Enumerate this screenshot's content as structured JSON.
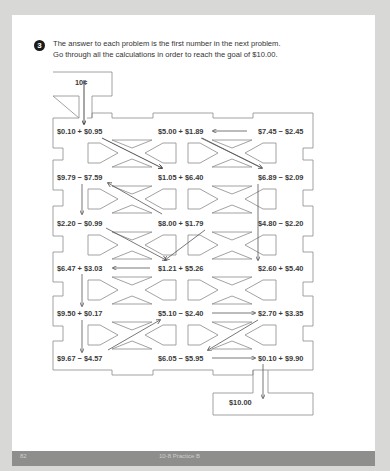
{
  "problem": {
    "number": "3",
    "instructions": [
      "The answer to each problem is the first number in the next problem.",
      "Go through all the calculations in order to reach the goal of $10.00."
    ]
  },
  "maze": {
    "start": "10¢",
    "goal": "$10.00",
    "rows": [
      [
        "$0.10 + $0.95",
        "$5.00 + $1.89",
        "$7.45 − $2.45"
      ],
      [
        "$9.79 − $7.59",
        "$1.05 + $6.40",
        "$6.89 − $2.09"
      ],
      [
        "$2.20 − $0.99",
        "$8.00 + $1.79",
        "$4.80 − $2.20"
      ],
      [
        "$6.47 + $3.03",
        "$1.21 + $5.26",
        "$2.60 + $5.40"
      ],
      [
        "$9.50 + $0.17",
        "$5.10 − $2.40",
        "$2.70 + $3.35"
      ],
      [
        "$9.67 − $4.57",
        "$6.05 − $5.95",
        "$0.10 + $9.90"
      ]
    ]
  },
  "footer": {
    "page_number": "82",
    "section": "10-8 Practice B"
  },
  "colors": {
    "background": "#d8d8d6",
    "footer_bar": "#8e8e8c",
    "line": "#8a8a8a"
  }
}
